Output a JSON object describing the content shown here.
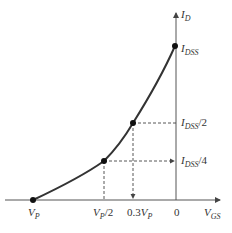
{
  "diagram": {
    "axes": {
      "y_label_main": "I",
      "y_label_sub": "D",
      "x_label_main": "V",
      "x_label_sub": "GS"
    },
    "y_ticks": [
      {
        "main": "I",
        "sub": "DSS",
        "suffix": ""
      },
      {
        "main": "I",
        "sub": "DSS",
        "suffix": "/2"
      },
      {
        "main": "I",
        "sub": "DSS",
        "suffix": "/4"
      }
    ],
    "x_ticks": [
      {
        "main": "V",
        "sub": "P",
        "suffix": ""
      },
      {
        "main": "V",
        "sub": "P",
        "suffix": "/2"
      },
      {
        "prefix": "0.3",
        "main": "V",
        "sub": "P"
      },
      {
        "main": "0"
      }
    ],
    "points": [
      {
        "name": "V_P",
        "vgs": "V_P",
        "id": "0"
      },
      {
        "name": "half-Vp",
        "vgs": "V_P/2",
        "id": "I_DSS/4"
      },
      {
        "name": "0.3Vp",
        "vgs": "0.3V_P",
        "id": "I_DSS/2"
      },
      {
        "name": "I_DSS",
        "vgs": "0",
        "id": "I_DSS"
      }
    ],
    "colors": {
      "curve": "#333333",
      "axis": "#555555",
      "dash": "#444444"
    }
  }
}
